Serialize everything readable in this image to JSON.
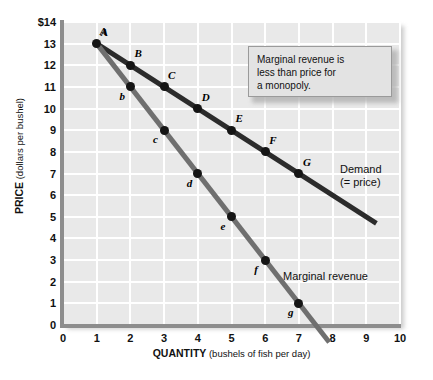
{
  "chart_data": {
    "type": "line",
    "title": "",
    "xlabel_bold": "QUANTITY",
    "xlabel_rest": "(bushels of fish per day)",
    "ylabel_bold": "PRICE",
    "ylabel_rest": "(dollars per bushel)",
    "xlim": [
      0,
      10
    ],
    "ylim": [
      0,
      14
    ],
    "grid": true,
    "xticks": [
      "0",
      "1",
      "2",
      "3",
      "4",
      "5",
      "6",
      "7",
      "8",
      "9",
      "10"
    ],
    "yticks": [
      "0",
      "1",
      "2",
      "3",
      "4",
      "5",
      "6",
      "7",
      "8",
      "9",
      "10",
      "11",
      "12",
      "13",
      "$14"
    ],
    "legend_position": "inline-right",
    "series": [
      {
        "name": "Demand (= price)",
        "label_line1": "Demand",
        "label_line2": "(= price)",
        "color": "#2b2b2b",
        "x": [
          1,
          2,
          3,
          4,
          5,
          6,
          7
        ],
        "values": [
          13,
          12,
          11,
          10,
          9,
          8,
          7
        ],
        "point_labels": [
          "A",
          "B",
          "C",
          "D",
          "E",
          "F",
          "G"
        ],
        "line_extends_to": {
          "x": 9.3,
          "y": 4.7
        }
      },
      {
        "name": "Marginal revenue",
        "label_line1": "Marginal revenue",
        "label_line2": "",
        "color": "#6f6f6f",
        "x": [
          1,
          2,
          3,
          4,
          5,
          6,
          7
        ],
        "values": [
          13,
          11,
          9,
          7,
          5,
          3,
          1
        ],
        "point_labels": [
          "A",
          "b",
          "c",
          "d",
          "e",
          "f",
          "g"
        ],
        "line_extends_to": {
          "x": 7.9,
          "y": -0.8
        }
      }
    ],
    "annotations": [
      {
        "id": "callout",
        "line1": "Marginal revenue is",
        "line2": "less than price for",
        "line3": "a monopoly."
      }
    ]
  }
}
